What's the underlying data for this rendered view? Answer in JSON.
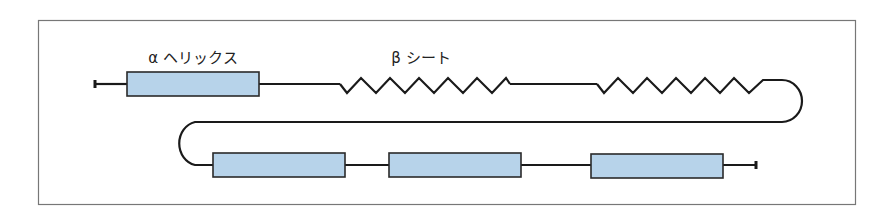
{
  "diagram": {
    "labels": {
      "alpha_helix": "α ヘリックス",
      "beta_sheet": "β シート"
    },
    "colors": {
      "helix_fill": "#b7d3ea",
      "stroke": "#1a1a1a",
      "frame": "#777777"
    },
    "elements": [
      {
        "type": "terminus",
        "row": 1
      },
      {
        "type": "alpha-helix",
        "row": 1,
        "label": "α ヘリックス"
      },
      {
        "type": "loop",
        "row": 1
      },
      {
        "type": "beta-strand",
        "row": 1,
        "label": "β シート"
      },
      {
        "type": "loop",
        "row": 1
      },
      {
        "type": "beta-strand",
        "row": 1
      },
      {
        "type": "turn",
        "row": "1-2"
      },
      {
        "type": "alpha-helix",
        "row": 2
      },
      {
        "type": "loop",
        "row": 2
      },
      {
        "type": "alpha-helix",
        "row": 2
      },
      {
        "type": "loop",
        "row": 2
      },
      {
        "type": "alpha-helix",
        "row": 2
      },
      {
        "type": "terminus",
        "row": 2
      }
    ]
  }
}
